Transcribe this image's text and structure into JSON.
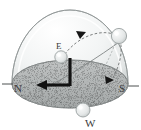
{
  "figure": {
    "background_color": "#ffffff",
    "dome_color": "#e8eaea",
    "dome_edge_color": "#9aa0a0",
    "ground_color": "#b9bcbc",
    "ground_edge_color": "#8d9292",
    "line_color": "#6e7272",
    "axis_color": "#1a1a1a",
    "body_color": "#e2e4e4",
    "label_color": "#3a3a3a"
  },
  "labels": {
    "north": "N",
    "south": "S",
    "east": "E",
    "west": "W"
  },
  "markers": {
    "rising_body": "sun-rising-marker",
    "upper_body": "sun-noon-marker",
    "setting_body": "sun-setting-marker"
  },
  "arrows": {
    "path_arrow_upper": "path-direction-arrow-upper",
    "path_arrow_lower": "path-direction-arrow-lower",
    "axis_arrow_horizontal": "axis-arrow-horizontal"
  },
  "elements": {
    "dome": "celestial-dome",
    "ground_plane": "horizon-ground-plane",
    "solar_path": "solar-path-arc",
    "meridian_arc": "meridian-arc",
    "zenith_axis": "zenith-axis-marker",
    "horizon_axis": "horizon-axis-marker"
  }
}
